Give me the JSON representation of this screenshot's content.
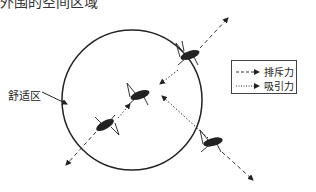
{
  "header": {
    "partial_text": "外围的空间区域"
  },
  "diagram": {
    "zone_label": "舒适区",
    "legend": {
      "items": [
        {
          "label": "排斥力",
          "style": "dashed"
        },
        {
          "label": "吸引力",
          "style": "dotted"
        }
      ]
    },
    "circle": {
      "cx": 132,
      "cy": 100,
      "r": 70
    },
    "insects": [
      {
        "name": "locust-upper-right",
        "x": 190,
        "y": 55
      },
      {
        "name": "locust-center",
        "x": 140,
        "y": 95
      },
      {
        "name": "locust-lower-left",
        "x": 105,
        "y": 125
      },
      {
        "name": "locust-lower-right",
        "x": 213,
        "y": 142
      }
    ]
  }
}
